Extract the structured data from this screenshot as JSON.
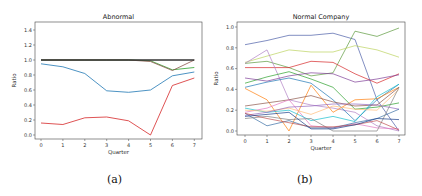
{
  "chart_data": [
    {
      "type": "line",
      "title": "Abnormal",
      "xlabel": "Quarter",
      "ylabel": "Ratio",
      "caption": "(a)",
      "x": [
        0,
        1,
        2,
        3,
        4,
        5,
        6,
        7
      ],
      "xticks": [
        "0",
        "1",
        "2",
        "3",
        "4",
        "5",
        "6",
        "7"
      ],
      "yticks": [
        "0.0",
        "0.2",
        "0.4",
        "0.6",
        "0.8",
        "1.0",
        "1.2",
        "1.4"
      ],
      "ylim": [
        0,
        1.5
      ],
      "grid": false,
      "series": [
        {
          "name": "s1",
          "color": "#1f77b4",
          "values": [
            0.95,
            0.91,
            0.82,
            0.59,
            0.57,
            0.6,
            0.79,
            0.84
          ]
        },
        {
          "name": "s2",
          "color": "#d62728",
          "values": [
            0.16,
            0.14,
            0.23,
            0.24,
            0.19,
            0.0,
            0.66,
            0.76
          ]
        },
        {
          "name": "s3",
          "color": "#2ca02c",
          "values": [
            1.0,
            1.0,
            1.0,
            1.0,
            1.0,
            0.99,
            0.87,
            0.9
          ]
        },
        {
          "name": "s4",
          "color": "#8c564b",
          "values": [
            1.0,
            1.0,
            1.0,
            1.0,
            1.0,
            0.98,
            0.86,
            1.0
          ]
        },
        {
          "name": "s5",
          "color": "#333333",
          "values": [
            1.0,
            1.0,
            1.0,
            1.0,
            1.0,
            1.0,
            1.0,
            1.0
          ]
        }
      ]
    },
    {
      "type": "line",
      "title": "Normal Company",
      "xlabel": "Quarter",
      "ylabel": "Ratio",
      "caption": "(b)",
      "x": [
        0,
        1,
        2,
        3,
        4,
        5,
        6,
        7
      ],
      "xticks": [
        "0",
        "1",
        "2",
        "3",
        "4",
        "5",
        "6",
        "7"
      ],
      "yticks": [
        "0.0",
        "0.2",
        "0.4",
        "0.6",
        "0.8",
        "1.0"
      ],
      "ylim": [
        -0.03,
        1.05
      ],
      "grid": false,
      "series": [
        {
          "name": "n1",
          "color": "#4c5fa8",
          "values": [
            0.83,
            0.87,
            0.92,
            0.92,
            0.94,
            0.88,
            0.3,
            0.0
          ]
        },
        {
          "name": "n2",
          "color": "#5c9a3c",
          "values": [
            0.65,
            0.67,
            0.61,
            0.53,
            0.56,
            0.96,
            0.91,
            0.99
          ]
        },
        {
          "name": "n3",
          "color": "#bcd35f",
          "values": [
            0.66,
            0.72,
            0.78,
            0.76,
            0.76,
            0.82,
            0.78,
            0.71
          ]
        },
        {
          "name": "n4",
          "color": "#d62728",
          "values": [
            0.61,
            0.61,
            0.61,
            0.67,
            0.66,
            0.55,
            0.46,
            0.55
          ]
        },
        {
          "name": "n5",
          "color": "#b07fc4",
          "values": [
            0.65,
            0.78,
            0.3,
            0.25,
            0.22,
            0.18,
            0.05,
            0.0
          ]
        },
        {
          "name": "n6",
          "color": "#2ca02c",
          "values": [
            0.46,
            0.52,
            0.57,
            0.5,
            0.42,
            0.21,
            0.23,
            0.27
          ]
        },
        {
          "name": "n7",
          "color": "#1f77b4",
          "values": [
            0.42,
            0.47,
            0.51,
            0.46,
            0.3,
            0.1,
            0.3,
            0.45
          ]
        },
        {
          "name": "n8",
          "color": "#7f3f98",
          "values": [
            0.51,
            0.48,
            0.53,
            0.56,
            0.55,
            0.47,
            0.5,
            0.54
          ]
        },
        {
          "name": "n9",
          "color": "#ff7f0e",
          "values": [
            0.41,
            0.3,
            0.0,
            0.44,
            0.18,
            0.3,
            0.31,
            0.42
          ]
        },
        {
          "name": "n10",
          "color": "#8c564b",
          "values": [
            0.24,
            0.27,
            0.3,
            0.34,
            0.28,
            0.24,
            0.25,
            0.42
          ]
        },
        {
          "name": "n11",
          "color": "#e377c2",
          "values": [
            0.18,
            0.22,
            0.3,
            0.05,
            0.03,
            0.07,
            0.03,
            0.02
          ]
        },
        {
          "name": "n12",
          "color": "#17becf",
          "values": [
            0.22,
            0.18,
            0.2,
            0.1,
            0.14,
            0.09,
            0.33,
            0.45
          ]
        },
        {
          "name": "n13",
          "color": "#ffbb78",
          "values": [
            0.2,
            0.19,
            0.22,
            0.16,
            0.24,
            0.21,
            0.2,
            0.4
          ]
        },
        {
          "name": "n14",
          "color": "#9467bd",
          "values": [
            0.15,
            0.18,
            0.23,
            0.24,
            0.26,
            0.26,
            0.25,
            0.21
          ]
        },
        {
          "name": "n15",
          "color": "#3a6ea5",
          "values": [
            0.17,
            0.05,
            0.1,
            0.03,
            0.03,
            0.08,
            0.12,
            0.21
          ]
        },
        {
          "name": "n16",
          "color": "#7f7f7f",
          "values": [
            0.12,
            0.14,
            0.11,
            0.12,
            0.0,
            0.0,
            0.0,
            0.42
          ]
        },
        {
          "name": "n17",
          "color": "#c05050",
          "values": [
            0.17,
            0.12,
            0.08,
            0.04,
            0.04,
            0.06,
            0.1,
            0.01
          ]
        },
        {
          "name": "n18",
          "color": "#1a3f8a",
          "values": [
            0.14,
            0.16,
            0.18,
            0.02,
            0.02,
            0.06,
            0.12,
            0.11
          ]
        }
      ]
    }
  ]
}
